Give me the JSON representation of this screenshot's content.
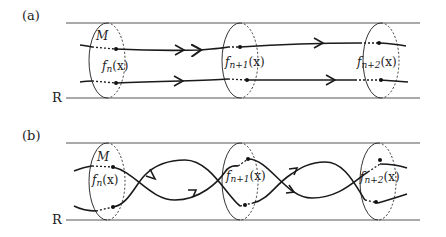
{
  "figure": {
    "panels": [
      {
        "id": "a",
        "label": "(a)",
        "base_label": "R",
        "manifold_label": "M",
        "fibers": [
          {
            "label_main": "f",
            "label_sub": "n",
            "label_tail": "(x)"
          },
          {
            "label_main": "f",
            "label_sub": "n+1",
            "label_tail": "(x)"
          },
          {
            "label_main": "f",
            "label_sub": "n+2",
            "label_tail": "(x)"
          }
        ],
        "description": "Two parallel trajectories passing through fibers without twisting"
      },
      {
        "id": "b",
        "label": "(b)",
        "base_label": "R",
        "manifold_label": "M",
        "fibers": [
          {
            "label_main": "f",
            "label_sub": "n",
            "label_tail": "(x)"
          },
          {
            "label_main": "f",
            "label_sub": "n+1",
            "label_tail": "(x)"
          },
          {
            "label_main": "f",
            "label_sub": "n+2",
            "label_tail": "(x)"
          }
        ],
        "description": "Two trajectories twisting around each other between fibers"
      }
    ],
    "colors": {
      "line": "#1a1a1a",
      "rail": "#555555",
      "background": "#ffffff"
    }
  }
}
